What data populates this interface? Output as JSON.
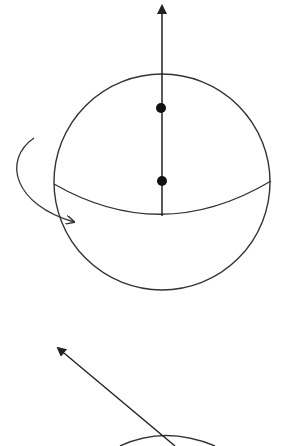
{
  "figure": {
    "colors": {
      "stroke": "#333333",
      "dot": "#111111",
      "background": "#ffffff"
    },
    "panels": [
      {
        "name": "sphere-vertical-axis",
        "sphere": {
          "cx": 162,
          "cy": 182,
          "r": 108
        },
        "axis": {
          "x1": 162,
          "y1": 216,
          "x2": 162,
          "y2": 6
        },
        "dots": [
          {
            "cx": 161,
            "cy": 108
          },
          {
            "cx": 162,
            "cy": 181
          }
        ],
        "equator": "M54 184 Q162 246 271 181",
        "rotation_arrow": "M34 138 C2 160 14 205 74 222"
      },
      {
        "name": "sphere-tilted-axis",
        "axis": {
          "x1": 175,
          "y1": 446,
          "x2": 58,
          "y2": 348
        },
        "partial_sphere": "M120 446 Q165 425 215 446"
      }
    ]
  }
}
